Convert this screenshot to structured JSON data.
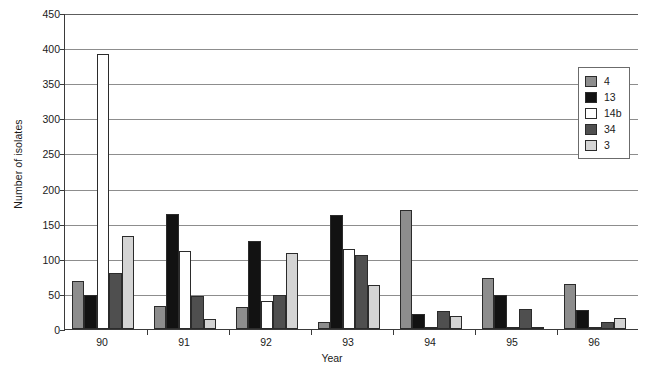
{
  "chart_data": {
    "type": "bar",
    "title": "",
    "xlabel": "Year",
    "ylabel": "Number of isolates",
    "ylim": [
      0,
      450
    ],
    "ytick_step": 50,
    "yticks": [
      0,
      50,
      100,
      150,
      200,
      250,
      300,
      350,
      400,
      450
    ],
    "grid": true,
    "legend_position": "top-right-inside",
    "categories": [
      "90",
      "91",
      "92",
      "93",
      "94",
      "95",
      "96"
    ],
    "series": [
      {
        "name": "4",
        "color": "#8d8d8d",
        "values": [
          68,
          33,
          32,
          10,
          170,
          73,
          64
        ]
      },
      {
        "name": "13",
        "color": "#121212",
        "values": [
          48,
          164,
          125,
          162,
          22,
          48,
          27
        ]
      },
      {
        "name": "14b",
        "color": "#ffffff",
        "values": [
          391,
          111,
          40,
          114,
          2,
          1,
          0
        ]
      },
      {
        "name": "34",
        "color": "#4f4f4f",
        "values": [
          80,
          47,
          48,
          105,
          25,
          28,
          10
        ]
      },
      {
        "name": "3",
        "color": "#d4d4d4",
        "values": [
          133,
          14,
          108,
          62,
          18,
          0,
          15
        ]
      }
    ]
  },
  "legend": {
    "entries": [
      {
        "label": "4"
      },
      {
        "label": "13"
      },
      {
        "label": "14b"
      },
      {
        "label": "34"
      },
      {
        "label": "3"
      }
    ]
  },
  "axes": {
    "y_title": "Number of isolates",
    "x_title": "Year"
  }
}
